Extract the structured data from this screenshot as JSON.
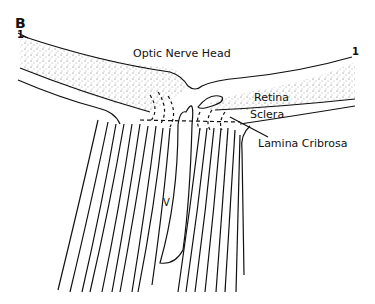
{
  "figure": {
    "panel_label": "B",
    "labels": {
      "optic_nerve_head": "Optic Nerve Head",
      "retina": "Retina",
      "sclera": "Sclera",
      "lamina_cribrosa": "Lamina Cribrosa",
      "vessel": "V",
      "section_marker_left": "1",
      "section_marker_right": "1"
    }
  }
}
